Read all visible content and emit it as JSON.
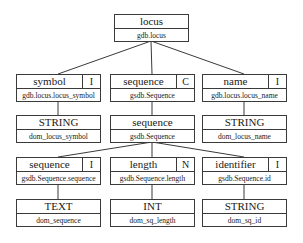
{
  "diagram": {
    "type": "tree",
    "nodes": {
      "locus": {
        "name": "locus",
        "sub": "gdb.locus"
      },
      "symbol": {
        "name": "symbol",
        "flag": "I",
        "sub": "gdb.locus.locus_symbol"
      },
      "sequence_c": {
        "name": "sequence",
        "flag": "C",
        "sub": "gsdb.Sequence"
      },
      "name": {
        "name": "name",
        "flag": "I",
        "sub": "gdb.locus.locus_name"
      },
      "string_symbol": {
        "name": "STRING",
        "sub": "dom_locus_symbol"
      },
      "sequence_class": {
        "name": "sequence",
        "sub": "gsdb.Sequence"
      },
      "string_name": {
        "name": "STRING",
        "sub": "dom_locus_name"
      },
      "sequence_i": {
        "name": "sequence",
        "flag": "I",
        "sub": "gsdb.Sequence.sequence"
      },
      "length": {
        "name": "length",
        "flag": "N",
        "sub": "gsdb.Sequence.length"
      },
      "identifier": {
        "name": "identifier",
        "flag": "I",
        "sub": "gsdb.Sequence.id"
      },
      "text": {
        "name": "TEXT",
        "sub": "dom_sequence"
      },
      "int": {
        "name": "INT",
        "sub": "dom_sq_length"
      },
      "string_id": {
        "name": "STRING",
        "sub": "dom_sq_id"
      }
    },
    "edges": [
      [
        "locus",
        "symbol"
      ],
      [
        "locus",
        "sequence_c"
      ],
      [
        "locus",
        "name"
      ],
      [
        "symbol",
        "string_symbol"
      ],
      [
        "sequence_c",
        "sequence_class"
      ],
      [
        "name",
        "string_name"
      ],
      [
        "sequence_class",
        "sequence_i"
      ],
      [
        "sequence_class",
        "length"
      ],
      [
        "sequence_class",
        "identifier"
      ],
      [
        "sequence_i",
        "text"
      ],
      [
        "length",
        "int"
      ],
      [
        "identifier",
        "string_id"
      ]
    ]
  }
}
